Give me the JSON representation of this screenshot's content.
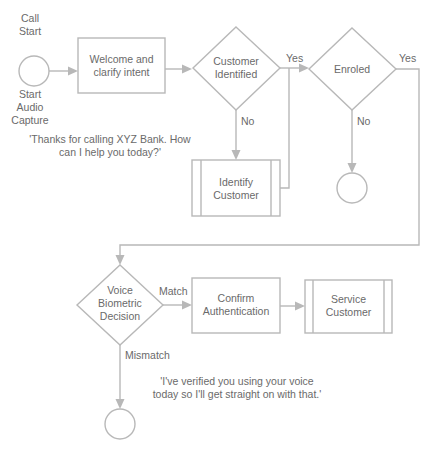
{
  "diagram": {
    "start": {
      "label_top": [
        "Call",
        "Start"
      ],
      "label_bottom": [
        "Start",
        "Audio",
        "Capture"
      ]
    },
    "welcome_box": {
      "lines": [
        "Welcome and",
        "clarify intent"
      ]
    },
    "customer_identified": {
      "lines": [
        "Customer",
        "Identified"
      ],
      "yes": "Yes",
      "no": "No"
    },
    "enroled": {
      "lines": [
        "Enroled"
      ],
      "yes": "Yes",
      "no": "No"
    },
    "identify_customer": {
      "lines": [
        "Identify",
        "Customer"
      ]
    },
    "greeting_quote": {
      "lines": [
        "'Thanks for calling XYZ Bank. How",
        "can I help you today?'"
      ]
    },
    "voice_biometric": {
      "lines": [
        "Voice",
        "Biometric",
        "Decision"
      ],
      "match": "Match",
      "mismatch": "Mismatch"
    },
    "confirm_auth": {
      "lines": [
        "Confirm",
        "Authentication"
      ]
    },
    "service_customer": {
      "lines": [
        "Service",
        "Customer"
      ]
    },
    "verified_quote": {
      "lines": [
        "'I've verified you using your voice",
        "today so I'll get straight on with that.'"
      ]
    }
  }
}
